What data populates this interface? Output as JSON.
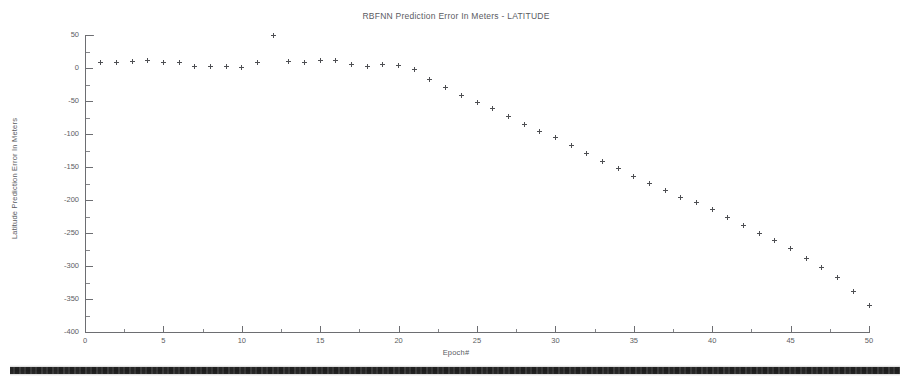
{
  "chart_data": {
    "type": "scatter",
    "title": "RBFNN Prediction Error In Meters - LATITUDE",
    "xlabel": "Epoch#",
    "ylabel": "Latitude Prediction Error In Meters",
    "xlim": [
      0,
      50
    ],
    "ylim": [
      -400,
      50
    ],
    "xticks": [
      0,
      5,
      10,
      15,
      20,
      25,
      30,
      35,
      40,
      45,
      50
    ],
    "xtick_labels": [
      "0",
      "5",
      "10",
      "15",
      "20",
      "25",
      "30",
      "35",
      "40",
      "45",
      "50"
    ],
    "yticks": [
      50,
      0,
      -50,
      -100,
      -150,
      -200,
      -250,
      -300,
      -350,
      -400
    ],
    "ytick_labels": [
      "50",
      "0",
      "-50",
      "-100",
      "-150",
      "-200",
      "-250",
      "-300",
      "-350",
      "-400"
    ],
    "grid": false,
    "legend": null,
    "marker": "plus",
    "marker_color": "#4e4f53",
    "series": [
      {
        "name": "Latitude prediction error",
        "x": [
          1,
          2,
          3,
          4,
          5,
          6,
          7,
          8,
          9,
          10,
          11,
          12,
          13,
          14,
          15,
          16,
          17,
          18,
          19,
          20,
          21,
          22,
          23,
          24,
          25,
          26,
          27,
          28,
          29,
          30,
          31,
          32,
          33,
          34,
          35,
          36,
          37,
          38,
          39,
          40,
          41,
          42,
          43,
          44,
          45,
          46,
          47,
          48,
          49,
          50
        ],
        "y": [
          9,
          8,
          10,
          12,
          9,
          8,
          2,
          3,
          2,
          1,
          9,
          50,
          10,
          8,
          11,
          12,
          6,
          3,
          5,
          4,
          -2,
          -18,
          -30,
          -41,
          -52,
          -62,
          -74,
          -86,
          -96,
          -106,
          -118,
          -130,
          -141,
          -152,
          -164,
          -175,
          -186,
          -196,
          -204,
          -214,
          -226,
          -238,
          -250,
          -262,
          -274,
          -288,
          -302,
          -318,
          -338,
          -360
        ]
      }
    ]
  },
  "artifacts": {
    "scan_band_label": "scan-artifact-band"
  }
}
